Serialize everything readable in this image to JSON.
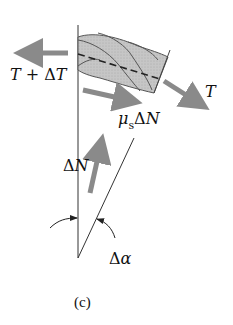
{
  "figure": {
    "caption": "(c)"
  },
  "labels": {
    "tension_left": {
      "T": "T",
      "plus": " + ",
      "delta": "Δ",
      "T2": "T"
    },
    "tension_right": "T",
    "friction": {
      "mu": "μ",
      "sub": "s",
      "delta": "Δ",
      "N": "N"
    },
    "normal": {
      "delta": "Δ",
      "N": "N"
    },
    "angle": {
      "delta": "Δ",
      "alpha": "α"
    }
  },
  "colors": {
    "arrow": "#8a8a8a",
    "rope_fill": "#c4c4c4",
    "rope_stroke": "#555555",
    "line": "#333333",
    "text": "#111111"
  }
}
